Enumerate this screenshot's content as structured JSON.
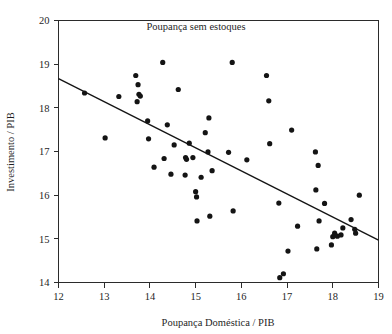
{
  "chart_data": {
    "type": "scatter",
    "title": "Poupança sem estoques",
    "xlabel": "Poupança Doméstica / PIB",
    "ylabel": "Investimento / PIB",
    "xlim": [
      12,
      19
    ],
    "ylim": [
      14,
      20
    ],
    "xticks": [
      12,
      13,
      14,
      15,
      16,
      17,
      18,
      19
    ],
    "yticks": [
      14,
      15,
      16,
      17,
      18,
      19,
      20
    ],
    "xtick_labels": [
      "12",
      "13",
      "14",
      "15",
      "16",
      "17",
      "18",
      "19"
    ],
    "ytick_labels": [
      "14",
      "15",
      "16",
      "17",
      "18",
      "19",
      "20"
    ],
    "grid": false,
    "legend": "none",
    "point_color": "#141414",
    "line_color": "#141414",
    "point_radius": 2.6,
    "series": [
      {
        "name": "Países",
        "points": [
          [
            12.57,
            18.34
          ],
          [
            13.02,
            17.31
          ],
          [
            13.32,
            18.26
          ],
          [
            13.69,
            18.74
          ],
          [
            13.74,
            18.53
          ],
          [
            13.76,
            18.31
          ],
          [
            13.79,
            18.27
          ],
          [
            13.72,
            18.14
          ],
          [
            13.95,
            17.7
          ],
          [
            13.97,
            17.29
          ],
          [
            14.09,
            16.64
          ],
          [
            14.28,
            19.04
          ],
          [
            14.31,
            16.84
          ],
          [
            14.38,
            17.61
          ],
          [
            14.46,
            16.48
          ],
          [
            14.53,
            17.15
          ],
          [
            14.62,
            18.42
          ],
          [
            14.78,
            16.86
          ],
          [
            14.8,
            16.82
          ],
          [
            14.77,
            16.46
          ],
          [
            14.86,
            17.19
          ],
          [
            14.94,
            16.86
          ],
          [
            15.0,
            16.08
          ],
          [
            15.02,
            15.96
          ],
          [
            15.03,
            15.41
          ],
          [
            15.12,
            16.41
          ],
          [
            15.21,
            17.43
          ],
          [
            15.29,
            17.77
          ],
          [
            15.27,
            16.99
          ],
          [
            15.31,
            15.52
          ],
          [
            15.36,
            16.56
          ],
          [
            15.72,
            16.98
          ],
          [
            15.8,
            19.04
          ],
          [
            15.82,
            15.64
          ],
          [
            16.12,
            16.81
          ],
          [
            16.55,
            18.74
          ],
          [
            16.62,
            17.18
          ],
          [
            16.6,
            18.16
          ],
          [
            16.82,
            15.82
          ],
          [
            16.84,
            14.11
          ],
          [
            16.92,
            14.2
          ],
          [
            17.02,
            14.72
          ],
          [
            17.1,
            17.49
          ],
          [
            17.23,
            15.29
          ],
          [
            17.62,
            16.99
          ],
          [
            17.63,
            16.12
          ],
          [
            17.65,
            14.77
          ],
          [
            17.68,
            16.68
          ],
          [
            17.7,
            15.41
          ],
          [
            17.82,
            15.81
          ],
          [
            17.97,
            14.86
          ],
          [
            18.0,
            15.05
          ],
          [
            18.04,
            15.13
          ],
          [
            18.1,
            15.06
          ],
          [
            18.18,
            15.09
          ],
          [
            18.22,
            15.25
          ],
          [
            18.4,
            15.44
          ],
          [
            18.48,
            15.22
          ],
          [
            18.5,
            15.13
          ],
          [
            18.58,
            16.0
          ]
        ]
      }
    ],
    "trend_line": {
      "name": "reta de regressão",
      "x_start": 12.0,
      "y_start": 18.67,
      "x_end": 19.0,
      "y_end": 14.97
    }
  }
}
